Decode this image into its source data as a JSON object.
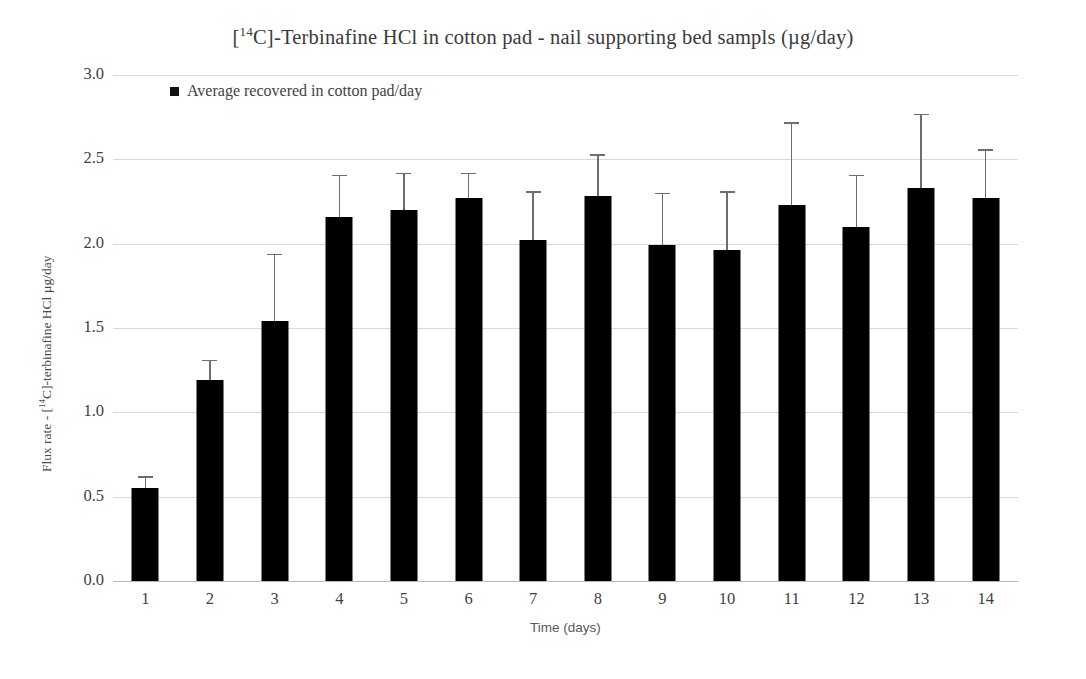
{
  "chart_data": {
    "type": "bar",
    "title": "[14C]-Terbinafine HCl in cotton pad - nail supporting bed sampls (µg/day)",
    "title_parts": {
      "prefix": "[",
      "superscript": "14",
      "suffix": "C]-Terbinafine  HCl in cotton pad - nail supporting  bed sampls (µg/day)"
    },
    "xlabel": "Time (days)",
    "ylabel": "Flux rate - [14C]-terbinafine HCl µg/day",
    "ylabel_parts": {
      "prefix": "Flux rate - [",
      "superscript": "14",
      "suffix": "C]-terbinafine HCl µg/day"
    },
    "categories": [
      "1",
      "2",
      "3",
      "4",
      "5",
      "6",
      "7",
      "8",
      "9",
      "10",
      "11",
      "12",
      "13",
      "14"
    ],
    "series": [
      {
        "name": "Average recovered in cotton pad/day",
        "values": [
          0.55,
          1.19,
          1.54,
          2.16,
          2.2,
          2.27,
          2.02,
          2.28,
          1.99,
          1.96,
          2.23,
          2.1,
          2.33,
          2.27
        ],
        "errors_upper": [
          0.62,
          1.31,
          1.94,
          2.41,
          2.42,
          2.42,
          2.31,
          2.53,
          2.3,
          2.31,
          2.72,
          2.41,
          2.77,
          2.56
        ],
        "color": "#000000"
      }
    ],
    "ylim": [
      0.0,
      3.0
    ],
    "ytick_labels": [
      "3.0",
      "2.5",
      "2.0",
      "1.5",
      "1.0",
      "0.5",
      "0.0"
    ],
    "ytick_values": [
      3.0,
      2.5,
      2.0,
      1.5,
      1.0,
      0.5,
      0.0
    ],
    "grid": true,
    "legend_position": "top-left",
    "error_bar_style": "upper-only-capped",
    "bar_color": "#000000",
    "grid_color": "#d9d9d9",
    "error_color": "#6e6e6e"
  },
  "legend": {
    "items": [
      {
        "label": "Average recovered in cotton pad/day",
        "marker": "square",
        "color": "#111111"
      }
    ]
  }
}
